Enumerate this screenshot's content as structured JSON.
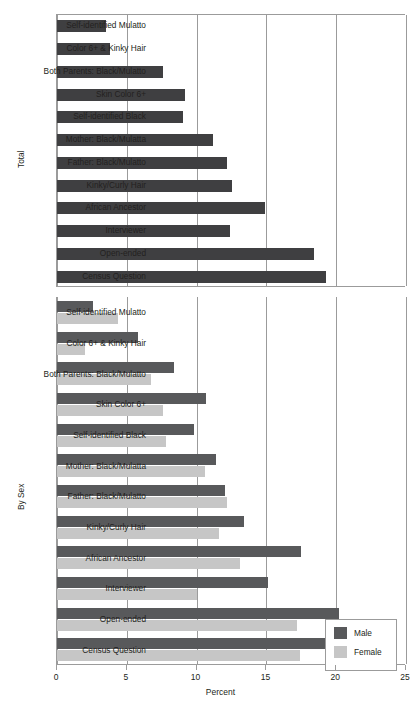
{
  "chart_data": {
    "type": "bar",
    "orientation": "horizontal",
    "title": "",
    "xlabel": "Percent",
    "ylabel": "",
    "xlim": [
      0,
      25
    ],
    "xticks": [
      0,
      5,
      10,
      15,
      20,
      25
    ],
    "xtick_labels": [
      "0",
      "5",
      "10",
      "15",
      "20",
      "25"
    ],
    "grid": "vertical",
    "legend": {
      "position": "upper-right-of-lower-panel",
      "entries": [
        {
          "label": "Male",
          "color": "#58595b"
        },
        {
          "label": "Female",
          "color": "#c6c6c6"
        }
      ]
    },
    "categories": [
      "Self-identified Mulatto",
      "Color 6+ & Kinky Hair",
      "Both Parents: Black/Mulatto",
      "Skin Color 6+",
      "Self-identified Black",
      "Mother: Black/Mulatta",
      "Father: Black/Mulatto",
      "Kinky/Curly Hair",
      "African Ancestor",
      "Interviewer",
      "Open-ended",
      "Census Question"
    ],
    "panels": [
      {
        "name": "Total",
        "ylabel": "Total",
        "series": [
          {
            "name": "Total",
            "color": "#3f3f41",
            "values": [
              3.5,
              3.8,
              7.6,
              9.2,
              9.0,
              11.2,
              12.2,
              12.5,
              14.9,
              12.4,
              18.4,
              19.3
            ]
          }
        ]
      },
      {
        "name": "By Sex",
        "ylabel": "By Sex",
        "series": [
          {
            "name": "Male",
            "color": "#58595b",
            "values": [
              2.6,
              5.8,
              8.4,
              10.7,
              9.8,
              11.4,
              12.0,
              13.4,
              17.5,
              15.1,
              20.2,
              21.4
            ]
          },
          {
            "name": "Female",
            "color": "#c6c6c6",
            "values": [
              4.4,
              2.0,
              6.7,
              7.6,
              7.8,
              10.6,
              12.2,
              11.6,
              13.1,
              10.0,
              17.2,
              17.4
            ]
          }
        ]
      }
    ]
  },
  "axis": {
    "x_title": "Percent",
    "tick_labels": [
      "0",
      "5",
      "10",
      "15",
      "20",
      "25"
    ]
  },
  "panel_total": {
    "ylabel": "Total"
  },
  "panel_bysex": {
    "ylabel": "By Sex"
  },
  "legend": {
    "male_label": "Male",
    "female_label": "Female"
  },
  "categories": {
    "c0": "Self-identified Mulatto",
    "c1": "Color 6+ & Kinky Hair",
    "c2": "Both Parents: Black/Mulatto",
    "c3": "Skin Color 6+",
    "c4": "Self-identified Black",
    "c5": "Mother: Black/Mulatta",
    "c6": "Father: Black/Mulatto",
    "c7": "Kinky/Curly Hair",
    "c8": "African Ancestor",
    "c9": "Interviewer",
    "c10": "Open-ended",
    "c11": "Census Question"
  }
}
